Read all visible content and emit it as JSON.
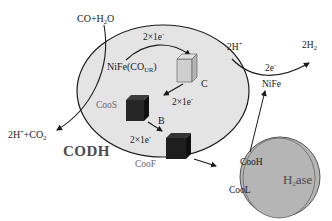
{
  "colors": {
    "codh_fill": "#e4e4e4",
    "codh_stroke": "#1a1a1a",
    "h2ase_fill": "#b5b5b5",
    "cube_light": "#cfcfcf",
    "cube_dark": "#1e1e1e",
    "text_gray": "#6b6b6b"
  },
  "reactants": {
    "input_label": "CO+H",
    "input_sub": "2",
    "input_tail": "O",
    "output_prefix": "2H",
    "output_sup": "+",
    "output_mid": "+CO",
    "output_sub": "2"
  },
  "codh": {
    "title": "CODH",
    "active_site_label": "NiFe(CO",
    "active_site_sub": "UR",
    "active_site_tail": ")",
    "cluster_c": "C",
    "cluster_b": "B",
    "cooS": "CooS",
    "cooF": "CooF",
    "transfer_1": "2×1e",
    "transfer_2": "2×1e",
    "transfer_3": "2×1e",
    "electron_sup": "-"
  },
  "h2ase": {
    "title_prefix": "H",
    "title_sub": "2",
    "title_tail": "ase",
    "cooH": "CooH",
    "cooL": "CooL",
    "site_label": "NiFe",
    "reaction_left": "2H",
    "reaction_left_sup": "+",
    "reaction_right": "2H",
    "reaction_right_sub": "2",
    "electrons": "2e",
    "electrons_sup": "-"
  }
}
